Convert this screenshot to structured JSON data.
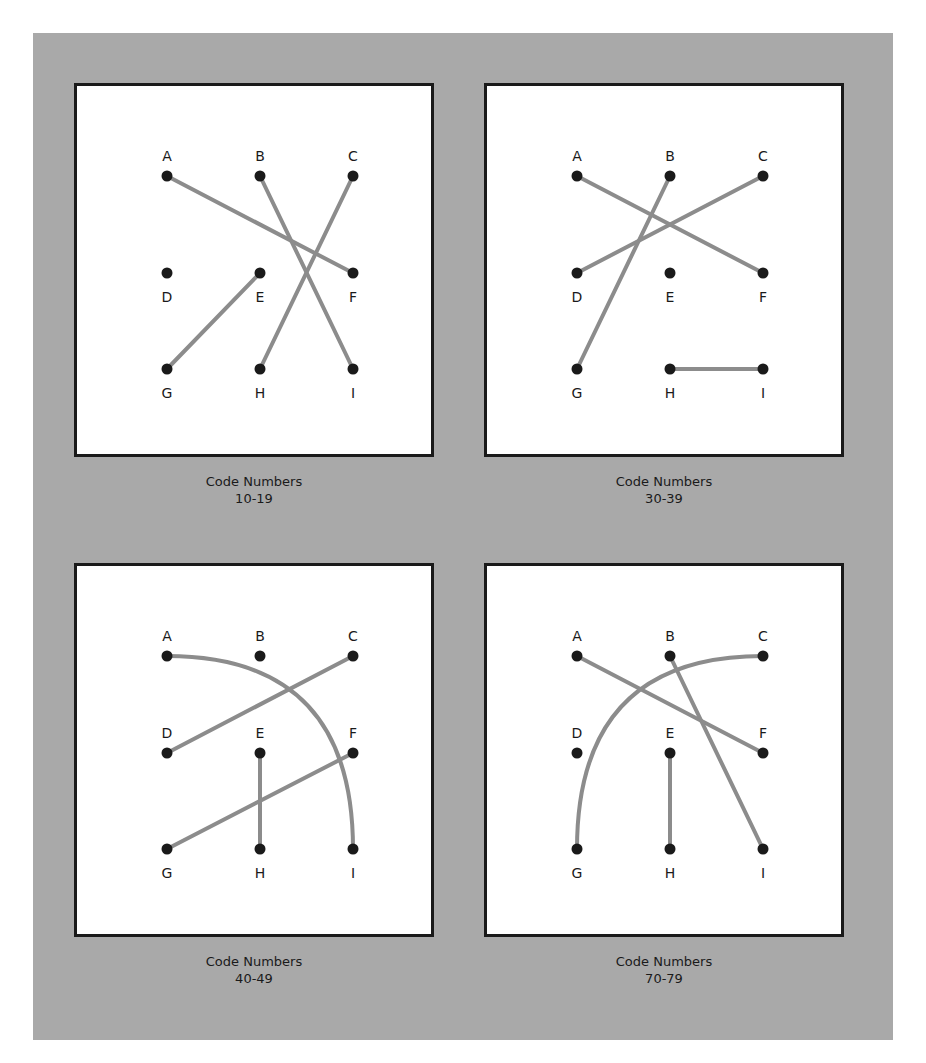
{
  "colors": {
    "background": "#a9a9a9",
    "panel": "#ffffff",
    "border": "#1a1a1a",
    "dot": "#1a1a1a",
    "connector": "#8c8c8c"
  },
  "panels": [
    {
      "caption_title": "Code Numbers",
      "caption_range": "10-19",
      "points": [
        "A",
        "B",
        "C",
        "D",
        "E",
        "F",
        "G",
        "H",
        "I"
      ],
      "connections": [
        {
          "from": "A",
          "to": "F",
          "shape": "straight"
        },
        {
          "from": "B",
          "to": "I",
          "shape": "straight"
        },
        {
          "from": "C",
          "to": "H",
          "shape": "straight"
        },
        {
          "from": "E",
          "to": "G",
          "shape": "straight"
        }
      ],
      "unconnected": [
        "D"
      ]
    },
    {
      "caption_title": "Code Numbers",
      "caption_range": "30-39",
      "points": [
        "A",
        "B",
        "C",
        "D",
        "E",
        "F",
        "G",
        "H",
        "I"
      ],
      "connections": [
        {
          "from": "A",
          "to": "F",
          "shape": "straight"
        },
        {
          "from": "B",
          "to": "G",
          "shape": "straight"
        },
        {
          "from": "C",
          "to": "D",
          "shape": "straight"
        },
        {
          "from": "H",
          "to": "I",
          "shape": "straight"
        }
      ],
      "unconnected": [
        "E"
      ]
    },
    {
      "caption_title": "Code Numbers",
      "caption_range": "40-49",
      "points": [
        "A",
        "B",
        "C",
        "D",
        "E",
        "F",
        "G",
        "H",
        "I"
      ],
      "connections": [
        {
          "from": "A",
          "to": "I",
          "shape": "arc"
        },
        {
          "from": "C",
          "to": "D",
          "shape": "straight"
        },
        {
          "from": "F",
          "to": "G",
          "shape": "straight"
        },
        {
          "from": "E",
          "to": "H",
          "shape": "straight"
        }
      ],
      "unconnected": [
        "B"
      ]
    },
    {
      "caption_title": "Code Numbers",
      "caption_range": "70-79",
      "points": [
        "A",
        "B",
        "C",
        "D",
        "E",
        "F",
        "G",
        "H",
        "I"
      ],
      "connections": [
        {
          "from": "A",
          "to": "F",
          "shape": "straight"
        },
        {
          "from": "B",
          "to": "I",
          "shape": "straight"
        },
        {
          "from": "C",
          "to": "G",
          "shape": "arc"
        },
        {
          "from": "E",
          "to": "H",
          "shape": "straight"
        }
      ],
      "unconnected": [
        "D"
      ]
    }
  ]
}
